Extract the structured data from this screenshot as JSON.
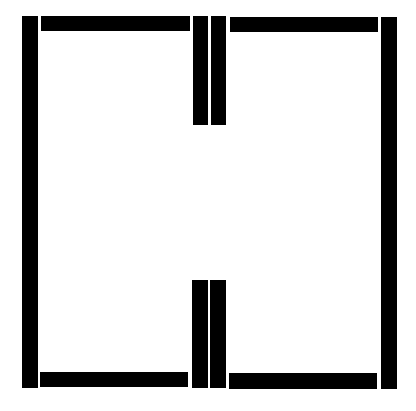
{
  "diagram": {
    "background": "#ffffff",
    "fill": "#000000",
    "bars": [
      {
        "name": "left-vertical-bar",
        "x": 22,
        "y": 16,
        "w": 16,
        "h": 372
      },
      {
        "name": "top-left-horizontal-bar",
        "x": 41,
        "y": 16,
        "w": 149,
        "h": 15
      },
      {
        "name": "top-middle-bar-left",
        "x": 193,
        "y": 16,
        "w": 15,
        "h": 109
      },
      {
        "name": "top-middle-bar-right",
        "x": 211,
        "y": 16,
        "w": 15,
        "h": 109
      },
      {
        "name": "top-right-horizontal-bar",
        "x": 230,
        "y": 17,
        "w": 148,
        "h": 15
      },
      {
        "name": "right-vertical-bar",
        "x": 381,
        "y": 17,
        "w": 16,
        "h": 372
      },
      {
        "name": "bottom-middle-bar-left",
        "x": 192,
        "y": 280,
        "w": 16,
        "h": 108
      },
      {
        "name": "bottom-middle-bar-right",
        "x": 210,
        "y": 280,
        "w": 16,
        "h": 108
      },
      {
        "name": "bottom-left-horizontal-bar",
        "x": 40,
        "y": 372,
        "w": 148,
        "h": 15
      },
      {
        "name": "bottom-right-horizontal-bar",
        "x": 229,
        "y": 373,
        "w": 148,
        "h": 16
      }
    ]
  }
}
